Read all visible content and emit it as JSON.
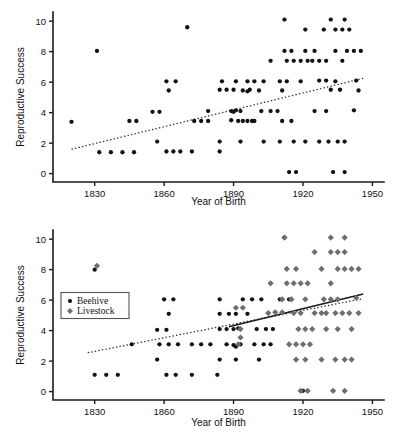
{
  "figure": {
    "width": 399,
    "height": 445,
    "background": "#ffffff",
    "marker_colors": {
      "beehive": "#121212",
      "livestock": "#6e6e6e"
    },
    "axis_color": "#1a1a1a"
  },
  "chart_data": [
    {
      "id": "panel-top",
      "type": "scatter",
      "title": "",
      "xlabel": "Year of Birth",
      "ylabel": "Reproductive Success",
      "xlim": [
        1812,
        1955
      ],
      "ylim": [
        -0.55,
        10.6
      ],
      "xticks": [
        1830,
        1860,
        1890,
        1920,
        1950
      ],
      "yticks": [
        0,
        2,
        4,
        6,
        8,
        10
      ],
      "grid": false,
      "legend": null,
      "series": [
        {
          "name": "Beehive",
          "marker": "circle",
          "color": "#121212",
          "points": [
            [
              1820,
              3.4
            ],
            [
              1831,
              8.05
            ],
            [
              1832,
              1.4
            ],
            [
              1837,
              1.4
            ],
            [
              1842,
              1.4
            ],
            [
              1847,
              1.4
            ],
            [
              1845,
              3.45
            ],
            [
              1848,
              3.45
            ],
            [
              1855,
              4.05
            ],
            [
              1858,
              4.05
            ],
            [
              1857,
              2.1
            ],
            [
              1861,
              6.05
            ],
            [
              1865,
              6.05
            ],
            [
              1862,
              5.45
            ],
            [
              1861,
              1.45
            ],
            [
              1864,
              1.45
            ],
            [
              1867,
              1.45
            ],
            [
              1870,
              9.6
            ],
            [
              1872,
              1.45
            ],
            [
              1873,
              3.45
            ],
            [
              1876,
              3.45
            ],
            [
              1879,
              3.45
            ],
            [
              1879,
              4.1
            ],
            [
              1884,
              1.45
            ],
            [
              1885,
              6.05
            ],
            [
              1884,
              5.5
            ],
            [
              1887,
              5.5
            ],
            [
              1890,
              5.5
            ],
            [
              1884,
              2.1
            ],
            [
              1891,
              6.05
            ],
            [
              1893,
              4.1
            ],
            [
              1889,
              4.1
            ],
            [
              1890,
              4.05
            ],
            [
              1891,
              4.15
            ],
            [
              1889,
              3.5
            ],
            [
              1892,
              3.45
            ],
            [
              1894,
              3.45
            ],
            [
              1896,
              3.45
            ],
            [
              1898,
              3.45
            ],
            [
              1894,
              5.45
            ],
            [
              1896,
              5.4
            ],
            [
              1897,
              5.5
            ],
            [
              1896,
              6.05
            ],
            [
              1899,
              6.05
            ],
            [
              1893,
              2.1
            ],
            [
              1899,
              3.45
            ],
            [
              1901,
              5.45
            ],
            [
              1903,
              6.05
            ],
            [
              1902,
              4.1
            ],
            [
              1906,
              4.1
            ],
            [
              1909,
              4.1
            ],
            [
              1903,
              2.1
            ],
            [
              1906,
              7.4
            ],
            [
              1912,
              10.1
            ],
            [
              1912,
              8.05
            ],
            [
              1915,
              8.05
            ],
            [
              1913,
              7.4
            ],
            [
              1916,
              7.4
            ],
            [
              1919,
              7.4
            ],
            [
              1922,
              7.4
            ],
            [
              1910,
              6.05
            ],
            [
              1913,
              6.05
            ],
            [
              1911,
              5.45
            ],
            [
              1911,
              3.45
            ],
            [
              1915,
              3.45
            ],
            [
              1910,
              2.1
            ],
            [
              1916,
              2.1
            ],
            [
              1914,
              0.1
            ],
            [
              1917,
              0.1
            ],
            [
              1921,
              9.45
            ],
            [
              1921,
              8.05
            ],
            [
              1925,
              8.05
            ],
            [
              1924,
              7.4
            ],
            [
              1927,
              7.4
            ],
            [
              1930,
              7.4
            ],
            [
              1919,
              6.05
            ],
            [
              1925,
              4.1
            ],
            [
              1930,
              4.1
            ],
            [
              1921,
              2.1
            ],
            [
              1932,
              10.1
            ],
            [
              1938,
              10.1
            ],
            [
              1929,
              9.45
            ],
            [
              1934,
              9.45
            ],
            [
              1937,
              9.45
            ],
            [
              1940,
              9.45
            ],
            [
              1934,
              8.05
            ],
            [
              1939,
              8.05
            ],
            [
              1942,
              8.05
            ],
            [
              1945,
              8.05
            ],
            [
              1937,
              7.4
            ],
            [
              1927,
              6.1
            ],
            [
              1930,
              6.1
            ],
            [
              1934,
              6.05
            ],
            [
              1943,
              6.1
            ],
            [
              1932,
              5.5
            ],
            [
              1936,
              5.5
            ],
            [
              1944,
              5.45
            ],
            [
              1942,
              4.15
            ],
            [
              1927,
              2.1
            ],
            [
              1931,
              2.1
            ],
            [
              1935,
              2.1
            ],
            [
              1938,
              2.1
            ],
            [
              1933,
              0.1
            ],
            [
              1938,
              0.1
            ]
          ]
        }
      ],
      "fits": [
        {
          "name": "beehive-trend",
          "style": "dotted",
          "color": "#2a2a2a",
          "x": [
            1820,
            1946
          ],
          "y": [
            1.6,
            6.25
          ]
        }
      ]
    },
    {
      "id": "panel-bottom",
      "type": "scatter",
      "title": "",
      "xlabel": "Year of Birth",
      "ylabel": "Reproductive Success",
      "xlim": [
        1812,
        1955
      ],
      "ylim": [
        -0.55,
        10.6
      ],
      "xticks": [
        1830,
        1860,
        1890,
        1920,
        1950
      ],
      "yticks": [
        0,
        2,
        4,
        6,
        8,
        10
      ],
      "grid": false,
      "legend": {
        "position": "left-middle",
        "entries": [
          {
            "label": "Beehive",
            "marker": "circle",
            "color": "#121212"
          },
          {
            "label": "Livestock",
            "marker": "diamond",
            "color": "#6e6e6e"
          }
        ]
      },
      "series": [
        {
          "name": "Beehive",
          "marker": "circle",
          "color": "#121212",
          "points": [
            [
              1830,
              8.0
            ],
            [
              1830,
              1.1
            ],
            [
              1835,
              1.1
            ],
            [
              1840,
              1.1
            ],
            [
              1846,
              3.1
            ],
            [
              1857,
              4.05
            ],
            [
              1861,
              4.05
            ],
            [
              1857,
              2.1
            ],
            [
              1860,
              6.05
            ],
            [
              1864,
              6.05
            ],
            [
              1862,
              5.1
            ],
            [
              1858,
              3.1
            ],
            [
              1862,
              3.1
            ],
            [
              1866,
              3.1
            ],
            [
              1861,
              1.1
            ],
            [
              1865,
              1.1
            ],
            [
              1872,
              1.1
            ],
            [
              1883,
              1.1
            ],
            [
              1872,
              3.1
            ],
            [
              1876,
              3.1
            ],
            [
              1880,
              3.1
            ],
            [
              1884,
              6.05
            ],
            [
              1884,
              5.1
            ],
            [
              1888,
              5.1
            ],
            [
              1891,
              5.1
            ],
            [
              1884,
              4.1
            ],
            [
              1887,
              4.1
            ],
            [
              1890,
              4.1
            ],
            [
              1892,
              4.15
            ],
            [
              1887,
              3.1
            ],
            [
              1890,
              3.05
            ],
            [
              1891,
              2.95
            ],
            [
              1893,
              3.1
            ],
            [
              1884,
              2.1
            ],
            [
              1891,
              2.1
            ],
            [
              1894,
              6.05
            ],
            [
              1898,
              6.05
            ],
            [
              1902,
              6.05
            ],
            [
              1896,
              5.1
            ],
            [
              1900,
              4.1
            ],
            [
              1904,
              4.1
            ],
            [
              1907,
              4.1
            ],
            [
              1899,
              3.1
            ],
            [
              1903,
              3.1
            ],
            [
              1906,
              3.1
            ],
            [
              1901,
              2.1
            ],
            [
              1912,
              10.1
            ],
            [
              1910,
              6.05
            ],
            [
              1914,
              6.05
            ],
            [
              1920,
              0.05
            ]
          ]
        },
        {
          "name": "Livestock",
          "marker": "diamond",
          "color": "#6e6e6e",
          "points": [
            [
              1831,
              8.25
            ],
            [
              1891,
              5.5
            ],
            [
              1894,
              5.5
            ],
            [
              1893,
              4.1
            ],
            [
              1893,
              3.55
            ],
            [
              1892,
              3.1
            ],
            [
              1912,
              10.1
            ],
            [
              1932,
              10.1
            ],
            [
              1938,
              10.1
            ],
            [
              1925,
              9.15
            ],
            [
              1932,
              9.15
            ],
            [
              1935,
              9.15
            ],
            [
              1938,
              9.15
            ],
            [
              1913,
              8.05
            ],
            [
              1917,
              8.05
            ],
            [
              1928,
              8.05
            ],
            [
              1935,
              8.05
            ],
            [
              1938,
              8.05
            ],
            [
              1941,
              8.05
            ],
            [
              1944,
              8.05
            ],
            [
              1906,
              7.1
            ],
            [
              1913,
              7.1
            ],
            [
              1916,
              7.1
            ],
            [
              1919,
              7.1
            ],
            [
              1922,
              7.1
            ],
            [
              1932,
              7.1
            ],
            [
              1911,
              6.05
            ],
            [
              1915,
              6.05
            ],
            [
              1921,
              6.05
            ],
            [
              1929,
              6.05
            ],
            [
              1932,
              6.05
            ],
            [
              1935,
              6.05
            ],
            [
              1943,
              6.15
            ],
            [
              1925,
              5.15
            ],
            [
              1928,
              5.15
            ],
            [
              1930,
              5.15
            ],
            [
              1934,
              5.15
            ],
            [
              1937,
              5.15
            ],
            [
              1940,
              5.15
            ],
            [
              1944,
              5.15
            ],
            [
              1916,
              5.15
            ],
            [
              1919,
              5.15
            ],
            [
              1908,
              5.2
            ],
            [
              1911,
              5.2
            ],
            [
              1905,
              5.15
            ],
            [
              1918,
              4.1
            ],
            [
              1921,
              4.1
            ],
            [
              1924,
              4.1
            ],
            [
              1930,
              4.1
            ],
            [
              1935,
              4.1
            ],
            [
              1941,
              4.1
            ],
            [
              1914,
              3.1
            ],
            [
              1917,
              3.1
            ],
            [
              1920,
              3.1
            ],
            [
              1923,
              3.1
            ],
            [
              1917,
              2.1
            ],
            [
              1921,
              2.1
            ],
            [
              1928,
              2.1
            ],
            [
              1934,
              2.1
            ],
            [
              1938,
              2.1
            ],
            [
              1941,
              2.1
            ],
            [
              1919,
              0.05
            ],
            [
              1922,
              0.05
            ],
            [
              1933,
              0.05
            ],
            [
              1938,
              0.05
            ]
          ]
        }
      ],
      "fits": [
        {
          "name": "beehive-trend",
          "style": "dotted",
          "color": "#2a2a2a",
          "x": [
            1827,
            1946
          ],
          "y": [
            2.55,
            6.1
          ]
        },
        {
          "name": "livestock-trend",
          "style": "solid",
          "color": "#1a1a1a",
          "x": [
            1888,
            1946
          ],
          "y": [
            4.25,
            6.4
          ]
        }
      ]
    }
  ]
}
